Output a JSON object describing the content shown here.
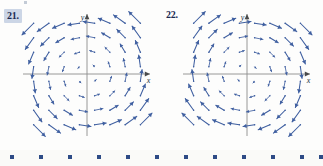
{
  "page": {
    "background_color": "#fdfdfc",
    "width": 323,
    "height": 166
  },
  "problems": [
    {
      "id": "21",
      "number_label": "21.",
      "highlighted": true,
      "highlight_color": "#ccd6e6"
    },
    {
      "id": "22",
      "number_label": "22.",
      "highlighted": false,
      "highlight_color": ""
    }
  ],
  "axes": {
    "x_label": "x",
    "y_label": "y",
    "axis_color": "#8c8c8c",
    "arrow_color": "#4a4a4a"
  },
  "vector_color": "#3f5fa0",
  "decorative_strip": {
    "square_color": "#2d4b86",
    "square_count": 12,
    "square_size": 4,
    "x_positions": [
      10,
      39,
      68,
      97,
      126,
      155,
      184,
      213,
      242,
      271,
      300,
      319
    ]
  },
  "chart_data": [
    {
      "type": "quiver",
      "id": "21",
      "title": "21.",
      "xlabel": "x",
      "ylabel": "y",
      "xlim": [
        -4,
        4
      ],
      "ylim": [
        -4,
        4
      ],
      "grid": false,
      "legend": null,
      "description": "Slope/vector field with clockwise-type circulation: arrows in quadrant II point down-left, quadrant I point left, quadrant III point right, quadrant IV point up.",
      "field_formula": "F(x, y) = <-y, -x>",
      "grid_x": [
        -3.5,
        -2.5,
        -1.5,
        -0.5,
        0.5,
        1.5,
        2.5,
        3.5
      ],
      "grid_y": [
        3.5,
        2.5,
        1.5,
        0.5,
        -0.5,
        -1.5,
        -2.5,
        -3.5
      ],
      "vectors": [
        {
          "x": -3.5,
          "y": 3.5,
          "u": -3.5,
          "v": -3.5
        },
        {
          "x": -2.5,
          "y": 3.5,
          "u": -3.5,
          "v": -2.5
        },
        {
          "x": -1.5,
          "y": 3.5,
          "u": -3.5,
          "v": -1.5
        },
        {
          "x": -0.5,
          "y": 3.5,
          "u": -3.5,
          "v": -0.5
        },
        {
          "x": 0.5,
          "y": 3.5,
          "u": -3.5,
          "v": 0.5
        },
        {
          "x": 1.5,
          "y": 3.5,
          "u": -3.5,
          "v": 1.5
        },
        {
          "x": 2.5,
          "y": 3.5,
          "u": -3.5,
          "v": 2.5
        },
        {
          "x": 3.5,
          "y": 3.5,
          "u": -3.5,
          "v": 3.5
        },
        {
          "x": -3.5,
          "y": 2.5,
          "u": -2.5,
          "v": -3.5
        },
        {
          "x": -2.5,
          "y": 2.5,
          "u": -2.5,
          "v": -2.5
        },
        {
          "x": -1.5,
          "y": 2.5,
          "u": -2.5,
          "v": -1.5
        },
        {
          "x": -0.5,
          "y": 2.5,
          "u": -2.5,
          "v": -0.5
        },
        {
          "x": 0.5,
          "y": 2.5,
          "u": -2.5,
          "v": 0.5
        },
        {
          "x": 1.5,
          "y": 2.5,
          "u": -2.5,
          "v": 1.5
        },
        {
          "x": 2.5,
          "y": 2.5,
          "u": -2.5,
          "v": 2.5
        },
        {
          "x": 3.5,
          "y": 2.5,
          "u": -2.5,
          "v": 3.5
        },
        {
          "x": -3.5,
          "y": 1.5,
          "u": -1.5,
          "v": -3.5
        },
        {
          "x": -2.5,
          "y": 1.5,
          "u": -1.5,
          "v": -2.5
        },
        {
          "x": -1.5,
          "y": 1.5,
          "u": -1.5,
          "v": -1.5
        },
        {
          "x": -0.5,
          "y": 1.5,
          "u": -1.5,
          "v": -0.5
        },
        {
          "x": 0.5,
          "y": 1.5,
          "u": -1.5,
          "v": 0.5
        },
        {
          "x": 1.5,
          "y": 1.5,
          "u": -1.5,
          "v": 1.5
        },
        {
          "x": 2.5,
          "y": 1.5,
          "u": -1.5,
          "v": 2.5
        },
        {
          "x": 3.5,
          "y": 1.5,
          "u": -1.5,
          "v": 3.5
        },
        {
          "x": -3.5,
          "y": 0.5,
          "u": -0.5,
          "v": -3.5
        },
        {
          "x": -2.5,
          "y": 0.5,
          "u": -0.5,
          "v": -2.5
        },
        {
          "x": -1.5,
          "y": 0.5,
          "u": -0.5,
          "v": -1.5
        },
        {
          "x": -0.5,
          "y": 0.5,
          "u": -0.5,
          "v": -0.5
        },
        {
          "x": 0.5,
          "y": 0.5,
          "u": -0.5,
          "v": 0.5
        },
        {
          "x": 1.5,
          "y": 0.5,
          "u": -0.5,
          "v": 1.5
        },
        {
          "x": 2.5,
          "y": 0.5,
          "u": -0.5,
          "v": 2.5
        },
        {
          "x": 3.5,
          "y": 0.5,
          "u": -0.5,
          "v": 3.5
        },
        {
          "x": -3.5,
          "y": -0.5,
          "u": 0.5,
          "v": -3.5
        },
        {
          "x": -2.5,
          "y": -0.5,
          "u": 0.5,
          "v": -2.5
        },
        {
          "x": -1.5,
          "y": -0.5,
          "u": 0.5,
          "v": -1.5
        },
        {
          "x": -0.5,
          "y": -0.5,
          "u": 0.5,
          "v": -0.5
        },
        {
          "x": 0.5,
          "y": -0.5,
          "u": 0.5,
          "v": 0.5
        },
        {
          "x": 1.5,
          "y": -0.5,
          "u": 0.5,
          "v": 1.5
        },
        {
          "x": 2.5,
          "y": -0.5,
          "u": 0.5,
          "v": 2.5
        },
        {
          "x": 3.5,
          "y": -0.5,
          "u": 0.5,
          "v": 3.5
        },
        {
          "x": -3.5,
          "y": -1.5,
          "u": 1.5,
          "v": -3.5
        },
        {
          "x": -2.5,
          "y": -1.5,
          "u": 1.5,
          "v": -2.5
        },
        {
          "x": -1.5,
          "y": -1.5,
          "u": 1.5,
          "v": -1.5
        },
        {
          "x": -0.5,
          "y": -1.5,
          "u": 1.5,
          "v": -0.5
        },
        {
          "x": 0.5,
          "y": -1.5,
          "u": 1.5,
          "v": 0.5
        },
        {
          "x": 1.5,
          "y": -1.5,
          "u": 1.5,
          "v": 1.5
        },
        {
          "x": 2.5,
          "y": -1.5,
          "u": 1.5,
          "v": 2.5
        },
        {
          "x": 3.5,
          "y": -1.5,
          "u": 1.5,
          "v": 3.5
        },
        {
          "x": -3.5,
          "y": -2.5,
          "u": 2.5,
          "v": -3.5
        },
        {
          "x": -2.5,
          "y": -2.5,
          "u": 2.5,
          "v": -2.5
        },
        {
          "x": -1.5,
          "y": -2.5,
          "u": 2.5,
          "v": -1.5
        },
        {
          "x": -0.5,
          "y": -2.5,
          "u": 2.5,
          "v": -0.5
        },
        {
          "x": 0.5,
          "y": -2.5,
          "u": 2.5,
          "v": 0.5
        },
        {
          "x": 1.5,
          "y": -2.5,
          "u": 2.5,
          "v": 1.5
        },
        {
          "x": 2.5,
          "y": -2.5,
          "u": 2.5,
          "v": 2.5
        },
        {
          "x": 3.5,
          "y": -2.5,
          "u": 2.5,
          "v": 3.5
        },
        {
          "x": -3.5,
          "y": -3.5,
          "u": 3.5,
          "v": -3.5
        },
        {
          "x": -2.5,
          "y": -3.5,
          "u": 3.5,
          "v": -2.5
        },
        {
          "x": -1.5,
          "y": -3.5,
          "u": 3.5,
          "v": -1.5
        },
        {
          "x": -0.5,
          "y": -3.5,
          "u": 3.5,
          "v": -0.5
        },
        {
          "x": 0.5,
          "y": -3.5,
          "u": 3.5,
          "v": 0.5
        },
        {
          "x": 1.5,
          "y": -3.5,
          "u": 3.5,
          "v": 1.5
        },
        {
          "x": 2.5,
          "y": -3.5,
          "u": 3.5,
          "v": 2.5
        },
        {
          "x": 3.5,
          "y": -3.5,
          "u": 3.5,
          "v": 3.5
        }
      ]
    },
    {
      "type": "quiver",
      "id": "22",
      "title": "22.",
      "xlabel": "x",
      "ylabel": "y",
      "xlim": [
        -4,
        4
      ],
      "ylim": [
        -4,
        4
      ],
      "grid": false,
      "legend": null,
      "description": "Slope/vector field with counter-clockwise-type circulation: arrows in quadrant II point right, quadrant I point up, quadrant III point down, quadrant IV point left.",
      "field_formula": "F(x, y) = <y, x>",
      "grid_x": [
        -3.5,
        -2.5,
        -1.5,
        -0.5,
        0.5,
        1.5,
        2.5,
        3.5
      ],
      "grid_y": [
        3.5,
        2.5,
        1.5,
        0.5,
        -0.5,
        -1.5,
        -2.5,
        -3.5
      ],
      "vectors": [
        {
          "x": -3.5,
          "y": 3.5,
          "u": 3.5,
          "v": 3.5
        },
        {
          "x": -2.5,
          "y": 3.5,
          "u": 3.5,
          "v": 2.5
        },
        {
          "x": -1.5,
          "y": 3.5,
          "u": 3.5,
          "v": 1.5
        },
        {
          "x": -0.5,
          "y": 3.5,
          "u": 3.5,
          "v": 0.5
        },
        {
          "x": 0.5,
          "y": 3.5,
          "u": 3.5,
          "v": -0.5
        },
        {
          "x": 1.5,
          "y": 3.5,
          "u": 3.5,
          "v": -1.5
        },
        {
          "x": 2.5,
          "y": 3.5,
          "u": 3.5,
          "v": -2.5
        },
        {
          "x": 3.5,
          "y": 3.5,
          "u": 3.5,
          "v": -3.5
        },
        {
          "x": -3.5,
          "y": 2.5,
          "u": 2.5,
          "v": 3.5
        },
        {
          "x": -2.5,
          "y": 2.5,
          "u": 2.5,
          "v": 2.5
        },
        {
          "x": -1.5,
          "y": 2.5,
          "u": 2.5,
          "v": 1.5
        },
        {
          "x": -0.5,
          "y": 2.5,
          "u": 2.5,
          "v": 0.5
        },
        {
          "x": 0.5,
          "y": 2.5,
          "u": 2.5,
          "v": -0.5
        },
        {
          "x": 1.5,
          "y": 2.5,
          "u": 2.5,
          "v": -1.5
        },
        {
          "x": 2.5,
          "y": 2.5,
          "u": 2.5,
          "v": -2.5
        },
        {
          "x": 3.5,
          "y": 2.5,
          "u": 2.5,
          "v": -3.5
        },
        {
          "x": -3.5,
          "y": 1.5,
          "u": 1.5,
          "v": 3.5
        },
        {
          "x": -2.5,
          "y": 1.5,
          "u": 1.5,
          "v": 2.5
        },
        {
          "x": -1.5,
          "y": 1.5,
          "u": 1.5,
          "v": 1.5
        },
        {
          "x": -0.5,
          "y": 1.5,
          "u": 1.5,
          "v": 0.5
        },
        {
          "x": 0.5,
          "y": 1.5,
          "u": 1.5,
          "v": -0.5
        },
        {
          "x": 1.5,
          "y": 1.5,
          "u": 1.5,
          "v": -1.5
        },
        {
          "x": 2.5,
          "y": 1.5,
          "u": 1.5,
          "v": -2.5
        },
        {
          "x": 3.5,
          "y": 1.5,
          "u": 1.5,
          "v": -3.5
        },
        {
          "x": -3.5,
          "y": 0.5,
          "u": 0.5,
          "v": 3.5
        },
        {
          "x": -2.5,
          "y": 0.5,
          "u": 0.5,
          "v": 2.5
        },
        {
          "x": -1.5,
          "y": 0.5,
          "u": 0.5,
          "v": 1.5
        },
        {
          "x": -0.5,
          "y": 0.5,
          "u": 0.5,
          "v": 0.5
        },
        {
          "x": 0.5,
          "y": 0.5,
          "u": 0.5,
          "v": -0.5
        },
        {
          "x": 1.5,
          "y": 0.5,
          "u": 0.5,
          "v": -1.5
        },
        {
          "x": 2.5,
          "y": 0.5,
          "u": 0.5,
          "v": -2.5
        },
        {
          "x": 3.5,
          "y": 0.5,
          "u": 0.5,
          "v": -3.5
        },
        {
          "x": -3.5,
          "y": -0.5,
          "u": -0.5,
          "v": 3.5
        },
        {
          "x": -2.5,
          "y": -0.5,
          "u": -0.5,
          "v": 2.5
        },
        {
          "x": -1.5,
          "y": -0.5,
          "u": -0.5,
          "v": 1.5
        },
        {
          "x": -0.5,
          "y": -0.5,
          "u": -0.5,
          "v": 0.5
        },
        {
          "x": 0.5,
          "y": -0.5,
          "u": -0.5,
          "v": -0.5
        },
        {
          "x": 1.5,
          "y": -0.5,
          "u": -0.5,
          "v": -1.5
        },
        {
          "x": 2.5,
          "y": -0.5,
          "u": -0.5,
          "v": -2.5
        },
        {
          "x": 3.5,
          "y": -0.5,
          "u": -0.5,
          "v": -3.5
        },
        {
          "x": -3.5,
          "y": -1.5,
          "u": -1.5,
          "v": 3.5
        },
        {
          "x": -2.5,
          "y": -1.5,
          "u": -1.5,
          "v": 2.5
        },
        {
          "x": -1.5,
          "y": -1.5,
          "u": -1.5,
          "v": 1.5
        },
        {
          "x": -0.5,
          "y": -1.5,
          "u": -1.5,
          "v": 0.5
        },
        {
          "x": 0.5,
          "y": -1.5,
          "u": -1.5,
          "v": -0.5
        },
        {
          "x": 1.5,
          "y": -1.5,
          "u": -1.5,
          "v": -1.5
        },
        {
          "x": 2.5,
          "y": -1.5,
          "u": -1.5,
          "v": -2.5
        },
        {
          "x": 3.5,
          "y": -1.5,
          "u": -1.5,
          "v": -3.5
        },
        {
          "x": -3.5,
          "y": -2.5,
          "u": -2.5,
          "v": 3.5
        },
        {
          "x": -2.5,
          "y": -2.5,
          "u": -2.5,
          "v": 2.5
        },
        {
          "x": -1.5,
          "y": -2.5,
          "u": -2.5,
          "v": 1.5
        },
        {
          "x": -0.5,
          "y": -2.5,
          "u": -2.5,
          "v": 0.5
        },
        {
          "x": 0.5,
          "y": -2.5,
          "u": -2.5,
          "v": -0.5
        },
        {
          "x": 1.5,
          "y": -2.5,
          "u": -2.5,
          "v": -1.5
        },
        {
          "x": 2.5,
          "y": -2.5,
          "u": -2.5,
          "v": -2.5
        },
        {
          "x": 3.5,
          "y": -2.5,
          "u": -2.5,
          "v": -3.5
        },
        {
          "x": -3.5,
          "y": -3.5,
          "u": -3.5,
          "v": 3.5
        },
        {
          "x": -2.5,
          "y": -3.5,
          "u": -3.5,
          "v": 2.5
        },
        {
          "x": -1.5,
          "y": -3.5,
          "u": -3.5,
          "v": 1.5
        },
        {
          "x": -0.5,
          "y": -3.5,
          "u": -3.5,
          "v": 0.5
        },
        {
          "x": 0.5,
          "y": -3.5,
          "u": -3.5,
          "v": -0.5
        },
        {
          "x": 1.5,
          "y": -3.5,
          "u": -3.5,
          "v": -1.5
        },
        {
          "x": 2.5,
          "y": -3.5,
          "u": -3.5,
          "v": -2.5
        },
        {
          "x": 3.5,
          "y": -3.5,
          "u": -3.5,
          "v": -3.5
        }
      ]
    }
  ]
}
